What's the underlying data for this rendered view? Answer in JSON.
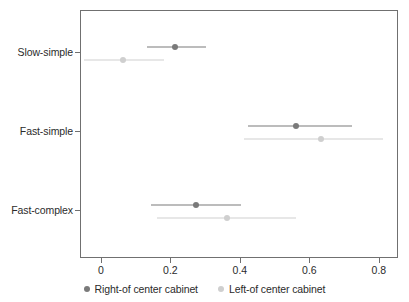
{
  "chart_data": {
    "type": "scatter",
    "title": "",
    "subtitle": "",
    "xlabel": "",
    "ylabel": "",
    "xlim": [
      -0.06,
      0.855
    ],
    "grid": false,
    "legend_position": "bottom",
    "orientation": "horizontal",
    "categories": [
      "Slow-simple",
      "Fast-simple",
      "Fast-complex"
    ],
    "xticks": [
      0,
      0.2,
      0.4,
      0.6,
      0.8
    ],
    "xticklabels": [
      "0",
      "0.2",
      "0.4",
      "0.6",
      "0.8"
    ],
    "series": [
      {
        "name": "Right-of center cabinet",
        "color": "#7a7a7a",
        "marker": "circle",
        "values": [
          0.21,
          0.56,
          0.27
        ],
        "ci_low": [
          0.13,
          0.42,
          0.14
        ],
        "ci_high": [
          0.3,
          0.72,
          0.4
        ]
      },
      {
        "name": "Left-of center cabinet",
        "color": "#cfcfcf",
        "marker": "circle",
        "values": [
          0.06,
          0.63,
          0.36
        ],
        "ci_low": [
          -0.05,
          0.41,
          0.16
        ],
        "ci_high": [
          0.18,
          0.81,
          0.56
        ]
      }
    ]
  },
  "axes": {
    "y_tick_labels": [
      "Slow-simple",
      "Fast-simple",
      "Fast-complex"
    ],
    "x_tick_labels": [
      "0",
      "0.2",
      "0.4",
      "0.6",
      "0.8"
    ]
  },
  "legend": {
    "entries": [
      {
        "label": "Right-of center cabinet",
        "color": "#7a7a7a"
      },
      {
        "label": "Left-of center cabinet",
        "color": "#cfcfcf"
      }
    ]
  },
  "colors": {
    "right_of_center": "#7a7a7a",
    "left_of_center": "#cfcfcf",
    "axis": "#707070",
    "text": "#2b2b2b",
    "background": "#ffffff"
  }
}
